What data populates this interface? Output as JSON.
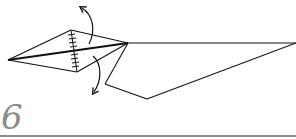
{
  "step": {
    "number": "6"
  },
  "figure": {
    "stroke_color": "#111111",
    "rule_color": "#8e8e8e",
    "step_number_color": "#8a8a8a",
    "arrows": [
      {
        "name": "fold-up-arrow",
        "direction": "up"
      },
      {
        "name": "fold-down-arrow",
        "direction": "down"
      }
    ]
  }
}
